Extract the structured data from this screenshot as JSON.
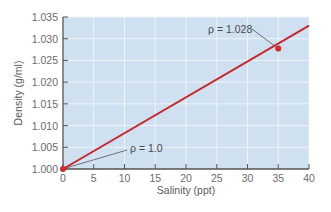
{
  "chart_data": {
    "type": "line",
    "title": "",
    "xlabel": "Salinity (ppt)",
    "ylabel": "Density (g/ml)",
    "xlim": [
      0,
      40
    ],
    "ylim": [
      1.0,
      1.035
    ],
    "x_ticks": [
      0,
      5,
      10,
      15,
      20,
      25,
      30,
      35,
      40
    ],
    "x_tick_labels": [
      "0",
      "5",
      "10",
      "15",
      "20",
      "25",
      "30",
      "35",
      "40"
    ],
    "y_ticks": [
      1.0,
      1.005,
      1.01,
      1.015,
      1.02,
      1.025,
      1.03,
      1.035
    ],
    "y_tick_labels": [
      "1.000",
      "1.005",
      "1.010",
      "1.015",
      "1.020",
      "1.025",
      "1.030",
      "1.035"
    ],
    "grid": true,
    "legend": null,
    "series": [
      {
        "name": "Seawater density",
        "color": "#c8262c",
        "x": [
          0,
          40
        ],
        "y": [
          1.0,
          1.033
        ]
      }
    ],
    "highlighted_points": [
      {
        "x": 0,
        "y": 1.0,
        "label": "ρ = 1.0"
      },
      {
        "x": 35,
        "y": 1.028,
        "label": "ρ = 1.028"
      }
    ],
    "annotations": [
      "ρ = 1.0",
      "ρ = 1.028"
    ]
  },
  "colors": {
    "plot_background": "#cfe0f0",
    "grid": "#eef4fa",
    "axis": "#555555",
    "line": "#c8262c",
    "point": "#d42a2a",
    "leader": "#555555"
  }
}
